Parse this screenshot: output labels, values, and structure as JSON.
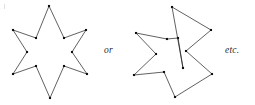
{
  "figure": {
    "background_color": "#ffffff",
    "stroke_color": "#1d1d1d",
    "vertex_color": "#101010",
    "text_color": "#2a2a2a",
    "width": 255,
    "height": 105
  },
  "captions": {
    "or": "or",
    "etc": "etc."
  },
  "shapes": [
    {
      "name": "six-pointed-star",
      "label": "regular six-pointed star polygon",
      "closed": true,
      "point_count": 12,
      "points": [
        [
          49,
          6
        ],
        [
          64,
          38
        ],
        [
          86,
          30
        ],
        [
          72,
          52
        ],
        [
          87,
          74
        ],
        [
          64,
          66
        ],
        [
          50,
          98
        ],
        [
          36,
          66
        ],
        [
          13,
          74
        ],
        [
          27,
          52
        ],
        [
          13,
          30
        ],
        [
          36,
          38
        ]
      ]
    },
    {
      "name": "irregular-five-pointed-star",
      "label": "irregular five-pointed star polygon",
      "closed": true,
      "point_count": 10,
      "points": [
        [
          172,
          7
        ],
        [
          211,
          30
        ],
        [
          186,
          51
        ],
        [
          212,
          74
        ],
        [
          175,
          97
        ],
        [
          164,
          72
        ],
        [
          134,
          75
        ],
        [
          156,
          54
        ],
        [
          136,
          33
        ],
        [
          167,
          39
        ],
        [
          178,
          38
        ],
        [
          183,
          68
        ]
      ]
    }
  ],
  "chart_data": {
    "type": "scatter",
    "xlabel": "",
    "ylabel": "",
    "series": [
      {
        "name": "six-pointed-star",
        "x": [
          49,
          64,
          86,
          72,
          87,
          64,
          50,
          36,
          13,
          27,
          13,
          36
        ],
        "y": [
          6,
          38,
          30,
          52,
          74,
          66,
          98,
          66,
          74,
          52,
          30,
          38
        ]
      },
      {
        "name": "irregular-five-pointed-star",
        "x": [
          172,
          211,
          186,
          212,
          175,
          164,
          134,
          156,
          136,
          167,
          178,
          183
        ],
        "y": [
          7,
          30,
          51,
          74,
          97,
          72,
          75,
          54,
          33,
          39,
          38,
          68
        ]
      }
    ]
  }
}
